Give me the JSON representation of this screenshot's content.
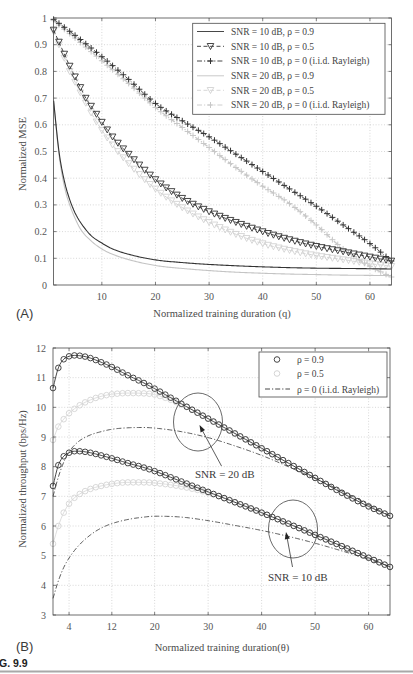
{
  "figure": {
    "label": "G. 9.9",
    "panel_a": "(A)",
    "panel_b": "(B)"
  },
  "chart_data": [
    {
      "type": "line",
      "panel": "(A)",
      "title": "",
      "xlabel": "Normalized training duration (q)",
      "ylabel": "Normalized MSE",
      "xlim": [
        1,
        64
      ],
      "ylim": [
        0,
        1
      ],
      "xticks": [
        10,
        20,
        30,
        40,
        50,
        60
      ],
      "xticklabels": [
        "10",
        "20",
        "30",
        "40",
        "50",
        "60"
      ],
      "yticks": [
        0,
        0.1,
        0.2,
        0.3,
        0.4,
        0.5,
        0.6,
        0.7,
        0.8,
        0.9,
        1
      ],
      "yticklabels": [
        "0",
        "0.1",
        "0.2",
        "0.3",
        "0.4",
        "0.5",
        "0.6",
        "0.7",
        "0.8",
        "0.9",
        "1"
      ],
      "grid": true,
      "legend_position": "upper right",
      "series": [
        {
          "id": "snr20-rho05",
          "name": "SNR = 20 dB, ρ = 0.5",
          "color": "#d2d2d2",
          "line": "dashed",
          "width": 1,
          "marker": "triangle-down",
          "x": [
            1,
            2,
            3,
            4,
            5,
            6,
            8,
            10,
            12,
            15,
            20,
            25,
            30,
            35,
            40,
            45,
            50,
            55,
            60,
            64
          ],
          "y": [
            0.95,
            0.9,
            0.85,
            0.8,
            0.76,
            0.72,
            0.645,
            0.58,
            0.525,
            0.455,
            0.36,
            0.29,
            0.235,
            0.19,
            0.155,
            0.13,
            0.11,
            0.095,
            0.08,
            0.07
          ]
        },
        {
          "id": "snr20-rho0",
          "name": "SNR = 20 dB, ρ = 0 (i.i.d. Rayleigh)",
          "color": "#c8c8c8",
          "line": "dashdot",
          "width": 1.4,
          "marker": "plus",
          "x": [
            1,
            5,
            10,
            15,
            20,
            25,
            30,
            35,
            40,
            45,
            50,
            55,
            60,
            64
          ],
          "y": [
            0.99,
            0.925,
            0.84,
            0.755,
            0.665,
            0.59,
            0.515,
            0.44,
            0.37,
            0.305,
            0.225,
            0.135,
            0.07,
            0.03
          ]
        },
        {
          "id": "snr20-rho09",
          "name": "SNR = 20 dB, ρ = 0.9",
          "color": "#c4c4c4",
          "line": "solid",
          "width": 1.1,
          "marker": "none",
          "x": [
            1,
            2,
            3,
            4,
            5,
            6,
            8,
            10,
            12,
            15,
            20,
            25,
            30,
            35,
            40,
            45,
            50,
            55,
            60,
            64
          ],
          "y": [
            0.69,
            0.49,
            0.37,
            0.3,
            0.25,
            0.21,
            0.165,
            0.135,
            0.115,
            0.095,
            0.073,
            0.062,
            0.054,
            0.048,
            0.044,
            0.041,
            0.039,
            0.037,
            0.036,
            0.035
          ]
        },
        {
          "id": "snr10-rho09",
          "name": "SNR = 10 dB, ρ = 0.9",
          "color": "#333333",
          "line": "solid",
          "width": 1.1,
          "marker": "none",
          "x": [
            1,
            2,
            3,
            4,
            5,
            6,
            8,
            10,
            12,
            15,
            20,
            25,
            30,
            35,
            40,
            45,
            50,
            55,
            60,
            64
          ],
          "y": [
            0.69,
            0.5,
            0.39,
            0.32,
            0.27,
            0.235,
            0.185,
            0.157,
            0.135,
            0.115,
            0.094,
            0.084,
            0.077,
            0.072,
            0.068,
            0.065,
            0.063,
            0.062,
            0.061,
            0.06
          ]
        },
        {
          "id": "snr10-rho05",
          "name": "SNR = 10 dB, ρ = 0.5",
          "color": "#333333",
          "line": "dashed",
          "width": 0.9,
          "marker": "triangle-down",
          "x": [
            1,
            2,
            3,
            4,
            5,
            6,
            7,
            8,
            9,
            10,
            12,
            15,
            20,
            25,
            30,
            35,
            40,
            45,
            50,
            55,
            60,
            64
          ],
          "y": [
            0.955,
            0.91,
            0.865,
            0.82,
            0.78,
            0.74,
            0.7,
            0.67,
            0.64,
            0.61,
            0.555,
            0.49,
            0.395,
            0.325,
            0.275,
            0.235,
            0.2,
            0.17,
            0.145,
            0.125,
            0.105,
            0.09
          ]
        },
        {
          "id": "snr10-rho0",
          "name": "SNR = 10 dB, ρ = 0 (i.i.d. Rayleigh)",
          "color": "#333333",
          "line": "dashdot",
          "width": 0.9,
          "marker": "plus",
          "x": [
            1,
            5,
            10,
            15,
            20,
            25,
            30,
            35,
            40,
            45,
            50,
            55,
            60,
            64
          ],
          "y": [
            0.995,
            0.935,
            0.855,
            0.77,
            0.68,
            0.615,
            0.555,
            0.49,
            0.425,
            0.36,
            0.295,
            0.225,
            0.155,
            0.09
          ]
        }
      ],
      "legend": [
        {
          "label": "SNR = 10 dB, ρ = 0.9",
          "color": "#333333",
          "line": "solid",
          "marker": "none"
        },
        {
          "label": "SNR = 10 dB, ρ = 0.5",
          "color": "#333333",
          "line": "dashed",
          "marker": "triangle-down"
        },
        {
          "label": "SNR = 10 dB, ρ = 0 (i.i.d. Rayleigh)",
          "color": "#333333",
          "line": "dashdot",
          "marker": "plus"
        },
        {
          "label": "SNR = 20 dB, ρ = 0.9",
          "color": "#c4c4c4",
          "line": "solid",
          "marker": "none"
        },
        {
          "label": "SNR = 20 dB, ρ = 0.5",
          "color": "#d2d2d2",
          "line": "dashed",
          "marker": "triangle-down"
        },
        {
          "label": "SNR = 20 dB, ρ = 0 (i.i.d. Rayleigh)",
          "color": "#c8c8c8",
          "line": "dashdot",
          "marker": "plus"
        }
      ]
    },
    {
      "type": "line",
      "panel": "(B)",
      "title": "",
      "xlabel": "Normalized training duration(θ)",
      "ylabel": "Normalized throughput (bps/Hz)",
      "xlim": [
        1,
        64
      ],
      "ylim": [
        3,
        12
      ],
      "xticks": [
        4,
        12,
        20,
        30,
        40,
        50,
        60
      ],
      "xticklabels": [
        "4",
        "12",
        "20",
        "30",
        "40",
        "50",
        "60"
      ],
      "yticks": [
        3,
        4,
        5,
        6,
        7,
        8,
        9,
        10,
        11,
        12
      ],
      "yticklabels": [
        "3",
        "4",
        "5",
        "6",
        "7",
        "8",
        "9",
        "10",
        "11",
        "12"
      ],
      "grid": true,
      "legend_position": "upper right",
      "series": [
        {
          "id": "snr20-rho05",
          "name": "SNR = 20 dB, ρ = 0.5",
          "color": "#d4d4d4",
          "line": "solid",
          "width": 0.8,
          "marker": "circle",
          "x": [
            1,
            2,
            3,
            4,
            5,
            6,
            8,
            10,
            12,
            15,
            18,
            20,
            25,
            30,
            35,
            40,
            45,
            50,
            55,
            60,
            64
          ],
          "y": [
            8.9,
            9.35,
            9.6,
            9.8,
            9.95,
            10.07,
            10.25,
            10.37,
            10.44,
            10.48,
            10.47,
            10.43,
            10.1,
            9.62,
            9.12,
            8.62,
            8.12,
            7.62,
            7.12,
            6.66,
            6.34
          ]
        },
        {
          "id": "snr10-rho05",
          "name": "SNR = 10 dB, ρ = 0.5",
          "color": "#d4d4d4",
          "line": "solid",
          "width": 0.8,
          "marker": "circle",
          "x": [
            1,
            2,
            3,
            4,
            5,
            6,
            8,
            10,
            12,
            15,
            18,
            20,
            25,
            30,
            35,
            40,
            45,
            50,
            55,
            60,
            64
          ],
          "y": [
            5.4,
            6.0,
            6.45,
            6.75,
            6.95,
            7.08,
            7.25,
            7.35,
            7.42,
            7.47,
            7.47,
            7.45,
            7.33,
            7.12,
            6.8,
            6.45,
            6.08,
            5.7,
            5.32,
            4.93,
            4.62
          ]
        },
        {
          "id": "snr20-rho0",
          "name": "SNR = 20 dB, ρ = 0 (i.i.d. Rayleigh)",
          "color": "#333333",
          "line": "dashdot",
          "width": 0.8,
          "marker": "none",
          "x": [
            1,
            2,
            3,
            4,
            5,
            6,
            8,
            10,
            12,
            15,
            18,
            20,
            25,
            30,
            35,
            40,
            45,
            50,
            55,
            60,
            64
          ],
          "y": [
            7.0,
            7.65,
            8.15,
            8.5,
            8.72,
            8.88,
            9.07,
            9.18,
            9.26,
            9.31,
            9.32,
            9.3,
            9.18,
            8.98,
            8.7,
            8.38,
            8.0,
            7.6,
            7.18,
            6.72,
            6.34
          ]
        },
        {
          "id": "snr10-rho0",
          "name": "SNR = 10 dB, ρ = 0 (i.i.d. Rayleigh)",
          "color": "#333333",
          "line": "dashdot",
          "width": 0.8,
          "marker": "none",
          "x": [
            1,
            2,
            3,
            4,
            5,
            6,
            8,
            10,
            12,
            15,
            18,
            20,
            25,
            30,
            35,
            40,
            45,
            50,
            55,
            60,
            64
          ],
          "y": [
            3.56,
            4.15,
            4.6,
            4.92,
            5.17,
            5.38,
            5.7,
            5.93,
            6.08,
            6.22,
            6.3,
            6.33,
            6.3,
            6.18,
            6.02,
            5.85,
            5.65,
            5.42,
            5.16,
            4.88,
            4.63
          ]
        },
        {
          "id": "snr20-rho09",
          "name": "SNR = 20 dB, ρ = 0.9",
          "color": "#333333",
          "line": "solid",
          "width": 0.9,
          "marker": "circle",
          "x": [
            1,
            2,
            3,
            4,
            5,
            6,
            7,
            8,
            10,
            12,
            15,
            18,
            20,
            25,
            30,
            35,
            40,
            45,
            50,
            55,
            60,
            64
          ],
          "y": [
            10.65,
            11.33,
            11.62,
            11.72,
            11.75,
            11.74,
            11.71,
            11.66,
            11.52,
            11.36,
            11.08,
            10.82,
            10.63,
            10.12,
            9.62,
            9.12,
            8.62,
            8.12,
            7.62,
            7.12,
            6.66,
            6.34
          ]
        },
        {
          "id": "snr10-rho09",
          "name": "SNR = 10 dB, ρ = 0.9",
          "color": "#333333",
          "line": "solid",
          "width": 0.9,
          "marker": "circle",
          "x": [
            1,
            2,
            3,
            4,
            5,
            6,
            7,
            8,
            10,
            12,
            15,
            18,
            20,
            25,
            30,
            35,
            40,
            45,
            50,
            55,
            60,
            64
          ],
          "y": [
            7.35,
            8.05,
            8.35,
            8.47,
            8.52,
            8.52,
            8.5,
            8.47,
            8.38,
            8.28,
            8.12,
            7.97,
            7.85,
            7.5,
            7.15,
            6.8,
            6.45,
            6.08,
            5.7,
            5.32,
            4.93,
            4.62
          ]
        }
      ],
      "legend": [
        {
          "label": "ρ = 0.9",
          "color": "#333333",
          "line": "none",
          "marker": "circle"
        },
        {
          "label": "ρ = 0.5",
          "color": "#cfcfcf",
          "line": "none",
          "marker": "circle"
        },
        {
          "label": "ρ = 0 (i.i.d. Rayleigh)",
          "color": "#333333",
          "line": "dashdot",
          "marker": "none"
        }
      ],
      "annotations": [
        {
          "text": "SNR = 20 dB",
          "target": "upper curve group (SNR = 20 dB)"
        },
        {
          "text": "SNR = 10 dB",
          "target": "lower curve group (SNR = 10 dB)"
        }
      ]
    }
  ]
}
